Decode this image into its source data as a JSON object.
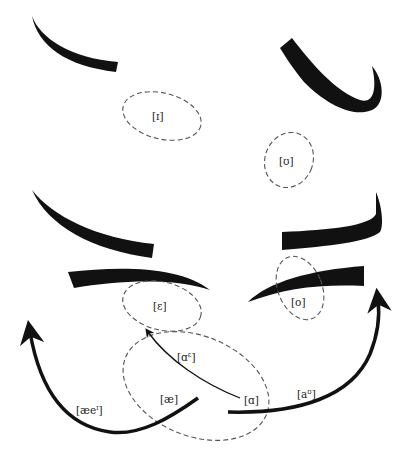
{
  "diagram": {
    "type": "vowel-shift-diagram",
    "top_caption_fragment": "",
    "vowel_regions": [
      {
        "id": "I",
        "label": "[ɪ]"
      },
      {
        "id": "U",
        "label": "[ʊ]"
      },
      {
        "id": "E",
        "label": "[ɛ]"
      },
      {
        "id": "O",
        "label": "[o]"
      },
      {
        "id": "AE",
        "label": "[æ]"
      },
      {
        "id": "A",
        "label": "[ɑ]"
      }
    ],
    "diphthong_labels": [
      {
        "id": "ae-i",
        "base": "[æe",
        "sup": "ɪ",
        "close": "]"
      },
      {
        "id": "a-e",
        "base": "[ɑ",
        "sup": "ɛ",
        "close": "]"
      },
      {
        "id": "a-u",
        "base": "[a",
        "sup": "ʊ",
        "close": "]"
      }
    ],
    "colors": {
      "ink": "#111111",
      "dashed_outline": "#555555",
      "background": "#ffffff"
    }
  }
}
